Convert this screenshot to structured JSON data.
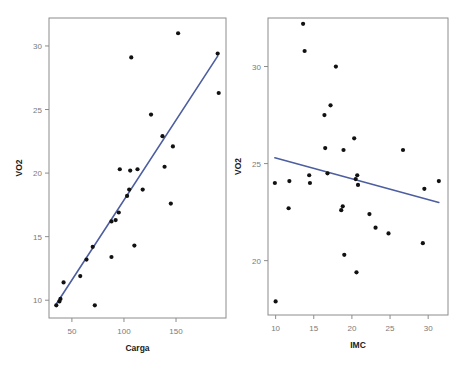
{
  "figure": {
    "width": 465,
    "height": 369,
    "background": "#ffffff",
    "panel_count": 2
  },
  "style": {
    "point_color": "#111111",
    "line_color": "#4d5ea0",
    "frame_color": "#8c8c8c",
    "tick_label_color": "#7a7a7a",
    "axis_title_color": "#1a1a1a"
  },
  "chart_data": [
    {
      "type": "scatter",
      "id": "vo2-vs-carga",
      "title": "",
      "xlabel": "Carga",
      "ylabel": "VO2",
      "xlim": [
        28,
        198
      ],
      "ylim": [
        8.6,
        32.2
      ],
      "xticks": [
        50,
        100,
        150
      ],
      "xticklabels": [
        "50",
        "100",
        "150"
      ],
      "yticks": [
        10,
        15,
        20,
        25,
        30
      ],
      "yticklabels": [
        "10",
        "15",
        "20",
        "25",
        "30"
      ],
      "grid": false,
      "legend": null,
      "points": [
        {
          "x": 35,
          "y": 9.6
        },
        {
          "x": 38,
          "y": 9.9
        },
        {
          "x": 39,
          "y": 10.1
        },
        {
          "x": 42,
          "y": 11.4
        },
        {
          "x": 58,
          "y": 11.9
        },
        {
          "x": 64,
          "y": 13.2
        },
        {
          "x": 70,
          "y": 14.2
        },
        {
          "x": 72,
          "y": 9.6
        },
        {
          "x": 88,
          "y": 13.4
        },
        {
          "x": 88,
          "y": 16.2
        },
        {
          "x": 92,
          "y": 16.3
        },
        {
          "x": 95,
          "y": 16.9
        },
        {
          "x": 96,
          "y": 20.3
        },
        {
          "x": 103,
          "y": 18.2
        },
        {
          "x": 105,
          "y": 18.7
        },
        {
          "x": 106,
          "y": 20.2
        },
        {
          "x": 107,
          "y": 29.1
        },
        {
          "x": 110,
          "y": 14.3
        },
        {
          "x": 113,
          "y": 20.3
        },
        {
          "x": 118,
          "y": 18.7
        },
        {
          "x": 126,
          "y": 24.6
        },
        {
          "x": 137,
          "y": 22.9
        },
        {
          "x": 139,
          "y": 20.5
        },
        {
          "x": 145,
          "y": 17.6
        },
        {
          "x": 147,
          "y": 22.1
        },
        {
          "x": 152,
          "y": 31.0
        },
        {
          "x": 190,
          "y": 29.4
        },
        {
          "x": 191,
          "y": 26.3
        }
      ],
      "fit_line": {
        "type": "linear",
        "x_start": 35,
        "y_start": 9.7,
        "x_end": 190,
        "y_end": 29.2
      }
    },
    {
      "type": "scatter",
      "id": "vo2-vs-imc",
      "title": "",
      "xlabel": "IMC",
      "ylabel": "VO2",
      "xlim": [
        9.0,
        32.6
      ],
      "ylim": [
        17.2,
        32.5
      ],
      "xticks": [
        10,
        15,
        20,
        25,
        30
      ],
      "xticklabels": [
        "10",
        "15",
        "20",
        "25",
        "30"
      ],
      "yticks": [
        20,
        25,
        30
      ],
      "yticklabels": [
        "20",
        "25",
        "30"
      ],
      "grid": false,
      "legend": null,
      "points": [
        {
          "x": 9.9,
          "y": 24.0
        },
        {
          "x": 10.0,
          "y": 17.9
        },
        {
          "x": 11.7,
          "y": 22.7
        },
        {
          "x": 11.8,
          "y": 24.1
        },
        {
          "x": 13.6,
          "y": 32.2
        },
        {
          "x": 13.8,
          "y": 30.8
        },
        {
          "x": 14.4,
          "y": 24.4
        },
        {
          "x": 14.5,
          "y": 24.0
        },
        {
          "x": 16.4,
          "y": 27.5
        },
        {
          "x": 16.5,
          "y": 25.8
        },
        {
          "x": 16.8,
          "y": 24.5
        },
        {
          "x": 17.2,
          "y": 28.0
        },
        {
          "x": 17.9,
          "y": 30.0
        },
        {
          "x": 18.6,
          "y": 22.6
        },
        {
          "x": 18.8,
          "y": 22.8
        },
        {
          "x": 18.9,
          "y": 25.7
        },
        {
          "x": 19.0,
          "y": 20.3
        },
        {
          "x": 20.3,
          "y": 26.3
        },
        {
          "x": 20.5,
          "y": 24.2
        },
        {
          "x": 20.6,
          "y": 19.4
        },
        {
          "x": 20.7,
          "y": 24.4
        },
        {
          "x": 20.8,
          "y": 23.9
        },
        {
          "x": 22.3,
          "y": 22.4
        },
        {
          "x": 23.1,
          "y": 21.7
        },
        {
          "x": 24.8,
          "y": 21.4
        },
        {
          "x": 26.7,
          "y": 25.7
        },
        {
          "x": 29.3,
          "y": 20.9
        },
        {
          "x": 29.5,
          "y": 23.7
        },
        {
          "x": 31.4,
          "y": 24.1
        }
      ],
      "fit_line": {
        "type": "linear",
        "x_start": 9.9,
        "y_start": 25.3,
        "x_end": 31.4,
        "y_end": 23.0
      }
    }
  ]
}
